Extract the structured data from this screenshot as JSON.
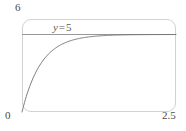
{
  "chart_data": {
    "type": "line",
    "title": "",
    "xlabel": "",
    "ylabel": "",
    "xlim": [
      0,
      2.5
    ],
    "ylim": [
      0,
      6
    ],
    "grid": false,
    "legend": null,
    "x_tick_labels": [
      "0",
      "2.5"
    ],
    "y_tick_labels": [
      "0",
      "6"
    ],
    "x_min_label": "0",
    "x_max_label": "2.5",
    "y_min_label": "0",
    "y_max_label": "6",
    "annotations": [
      {
        "name": "asymptote-label",
        "text": "y = 5",
        "variable": "y",
        "operator": "=",
        "value": "5",
        "x": 0.5,
        "y": 5.45
      }
    ],
    "series": [
      {
        "name": "asymptote",
        "type": "line",
        "style": "solid-horizontal",
        "color": "#8c8c8c",
        "y_constant": 5,
        "x": [
          0,
          2.5
        ],
        "values": [
          5,
          5
        ]
      },
      {
        "name": "saturation-curve",
        "type": "line",
        "color": "#6e6e6e",
        "equation": "y = 5(1 - e^(-3.2x))",
        "x": [
          0,
          0.1,
          0.2,
          0.3,
          0.4,
          0.5,
          0.6,
          0.7,
          0.8,
          0.9,
          1.0,
          1.2,
          1.4,
          1.6,
          1.8,
          2.0,
          2.25,
          2.5
        ],
        "values": [
          0,
          1.37,
          2.36,
          3.08,
          3.61,
          3.99,
          4.27,
          4.47,
          4.62,
          4.72,
          4.8,
          4.89,
          4.94,
          4.97,
          4.98,
          4.99,
          5.0,
          5.0
        ]
      }
    ]
  },
  "colors": {
    "frame": "#d2d2d2",
    "curve": "#6e6e6e",
    "asymptote": "#8c8c8c",
    "text": "#4a4a4a",
    "background": "#ffffff"
  }
}
